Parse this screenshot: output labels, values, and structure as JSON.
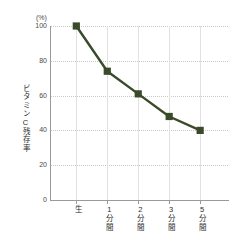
{
  "chart_data": {
    "type": "line",
    "title": "",
    "subtitle": "",
    "xlabel": "",
    "ylabel": "ビタミンC残存率",
    "unit_label": "(%)",
    "categories": [
      "生",
      "1分間",
      "2分間",
      "3分間",
      "5分間"
    ],
    "values": [
      100,
      74,
      61,
      48,
      40
    ],
    "series": [
      {
        "name": "ビタミンC残存率",
        "values": [
          100,
          74,
          61,
          48,
          40
        ],
        "color": "#3a4a2a",
        "marker": "square"
      }
    ],
    "ylim": [
      0,
      100
    ],
    "yticks": [
      0,
      20,
      40,
      60,
      80,
      100
    ],
    "ytick_labels": [
      "0",
      "20",
      "40",
      "60",
      "80",
      "100"
    ],
    "grid": {
      "horizontal": "dotted",
      "vertical": "solid",
      "horizontal_color": "#c9c9c9",
      "vertical_color": "#e2e2e2"
    },
    "legend": null,
    "legend_position": "none",
    "annotations": [],
    "line_color": "#3a4a2a",
    "marker_color": "#3a4a2a",
    "background_color": "#ffffff",
    "axis_color": "#9a9a9a"
  }
}
